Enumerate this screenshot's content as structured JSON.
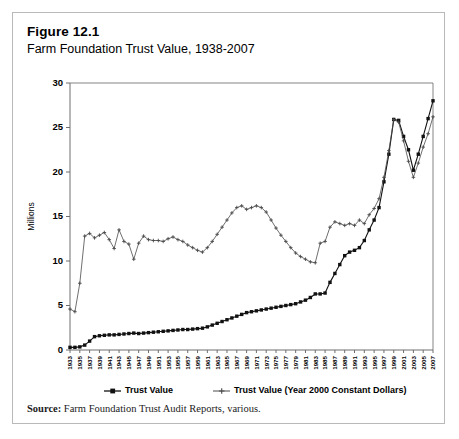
{
  "figure": {
    "number": "Figure 12.1",
    "title": "Farm Foundation Trust Value, 1938-2007",
    "source": "Source:",
    "source_text": " Farm Foundation Trust Audit Reports, various."
  },
  "colors": {
    "nominal": "#111111",
    "real": "#4a4a4a",
    "axis": "#6e6e6e",
    "border": "#b9b9b9",
    "background": "#ffffff"
  },
  "chart_data": {
    "type": "line",
    "title": "Farm Foundation Trust Value, 1938-2007",
    "xlabel": "",
    "ylabel": "Millions",
    "ylim": [
      0,
      30
    ],
    "yticks": [
      0,
      5,
      10,
      15,
      20,
      25,
      30
    ],
    "grid": false,
    "legend_position": "bottom",
    "xtick_step": 2,
    "xtick_labels": [
      "1933",
      "1935",
      "1937",
      "1939",
      "1941",
      "1943",
      "1945",
      "1947",
      "1949",
      "1951",
      "1953",
      "1955",
      "1957",
      "1959",
      "1961",
      "1963",
      "1965",
      "1967",
      "1969",
      "1971",
      "1973",
      "1975",
      "1977",
      "1979",
      "1981",
      "1983",
      "1985",
      "1987",
      "1989",
      "1991",
      "1993",
      "1995",
      "1997",
      "1999",
      "2001",
      "2003",
      "2005",
      "2007"
    ],
    "x": [
      1933,
      1934,
      1935,
      1936,
      1937,
      1938,
      1939,
      1940,
      1941,
      1942,
      1943,
      1944,
      1945,
      1946,
      1947,
      1948,
      1949,
      1950,
      1951,
      1952,
      1953,
      1954,
      1955,
      1956,
      1957,
      1958,
      1959,
      1960,
      1961,
      1962,
      1963,
      1964,
      1965,
      1966,
      1967,
      1968,
      1969,
      1970,
      1971,
      1972,
      1973,
      1974,
      1975,
      1976,
      1977,
      1978,
      1979,
      1980,
      1981,
      1982,
      1983,
      1984,
      1985,
      1986,
      1987,
      1988,
      1989,
      1990,
      1991,
      1992,
      1993,
      1994,
      1995,
      1996,
      1997,
      1998,
      1999,
      2000,
      2001,
      2002,
      2003,
      2004,
      2005,
      2006,
      2007
    ],
    "series": [
      {
        "name": "Trust Value",
        "marker": "square",
        "values": [
          0.3,
          0.3,
          0.35,
          0.55,
          1.0,
          1.5,
          1.6,
          1.65,
          1.7,
          1.7,
          1.75,
          1.8,
          1.85,
          1.9,
          1.85,
          1.9,
          1.95,
          2.0,
          2.05,
          2.1,
          2.15,
          2.2,
          2.25,
          2.3,
          2.3,
          2.35,
          2.4,
          2.45,
          2.6,
          2.8,
          3.0,
          3.2,
          3.4,
          3.6,
          3.8,
          4.0,
          4.2,
          4.3,
          4.4,
          4.5,
          4.6,
          4.7,
          4.8,
          4.9,
          5.0,
          5.1,
          5.2,
          5.4,
          5.6,
          5.9,
          6.3,
          6.3,
          6.4,
          7.6,
          8.6,
          9.6,
          10.6,
          11.0,
          11.2,
          11.5,
          12.3,
          13.5,
          14.6,
          16.0,
          18.9,
          22.0,
          25.9,
          25.8,
          24.0,
          22.5,
          20.2,
          22.0,
          24.0,
          26.0,
          28.0
        ]
      },
      {
        "name": "Trust Value (Year 2000 Constant Dollars)",
        "marker": "plus",
        "values": [
          4.6,
          4.3,
          7.5,
          12.8,
          13.1,
          12.6,
          12.9,
          13.2,
          12.4,
          11.4,
          13.5,
          12.2,
          11.9,
          10.2,
          12.0,
          12.8,
          12.4,
          12.3,
          12.3,
          12.2,
          12.5,
          12.7,
          12.4,
          12.2,
          11.8,
          11.5,
          11.2,
          11.0,
          11.5,
          12.2,
          13.0,
          13.8,
          14.6,
          15.4,
          16.0,
          16.2,
          15.8,
          16.0,
          16.2,
          16.0,
          15.5,
          14.6,
          13.7,
          12.9,
          12.2,
          11.5,
          10.9,
          10.5,
          10.2,
          9.9,
          9.8,
          12.0,
          12.2,
          13.8,
          14.4,
          14.2,
          14.0,
          14.2,
          14.0,
          14.6,
          14.2,
          15.2,
          15.9,
          17.0,
          19.4,
          22.4,
          25.9,
          25.6,
          23.5,
          21.2,
          19.4,
          21.0,
          22.8,
          24.3,
          26.2
        ]
      }
    ],
    "legend": [
      {
        "label": "Trust Value",
        "marker": "square"
      },
      {
        "label": "Trust Value (Year 2000 Constant Dollars)",
        "marker": "plus"
      }
    ]
  }
}
